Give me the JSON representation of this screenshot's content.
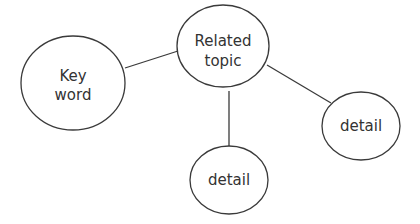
{
  "diagram": {
    "type": "mind-map",
    "nodes": [
      {
        "id": "key-word",
        "lines": [
          "Key",
          "word"
        ]
      },
      {
        "id": "related-topic",
        "lines": [
          "Related",
          "topic"
        ]
      },
      {
        "id": "detail-right",
        "lines": [
          "detail"
        ]
      },
      {
        "id": "detail-bottom",
        "lines": [
          "detail"
        ]
      }
    ],
    "edges": [
      {
        "from": "key-word",
        "to": "related-topic"
      },
      {
        "from": "related-topic",
        "to": "detail-bottom"
      },
      {
        "from": "related-topic",
        "to": "detail-right"
      }
    ]
  }
}
